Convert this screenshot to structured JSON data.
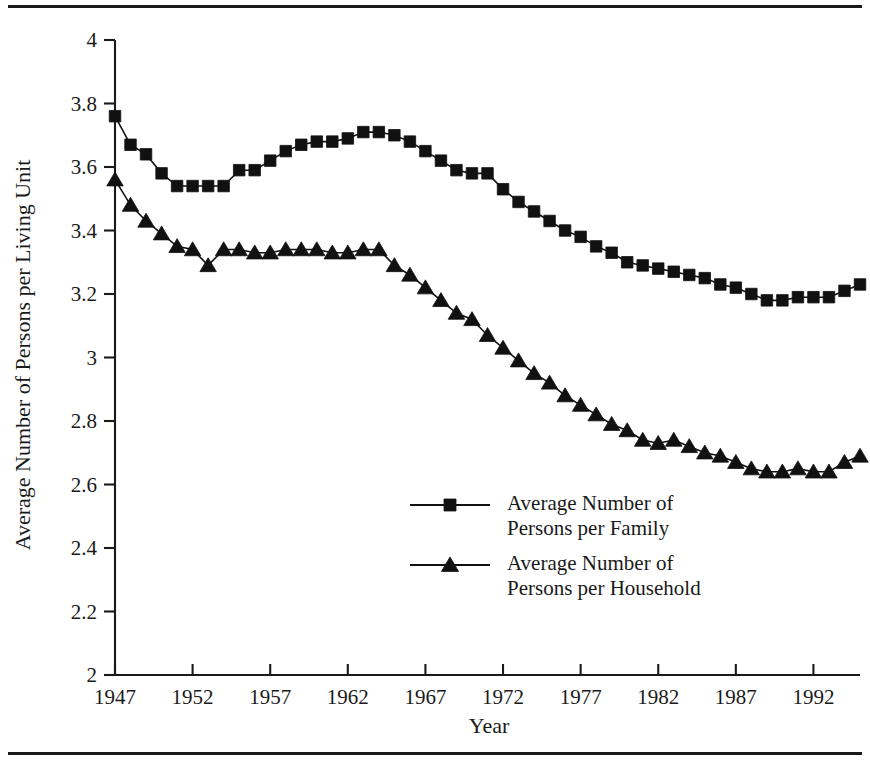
{
  "figure": {
    "top_rule": "horizontal-rule",
    "bottom_rule": "horizontal-rule"
  },
  "chart_data": {
    "type": "line",
    "title": "",
    "xlabel": "Year",
    "ylabel": "Average Number of Persons per Living Unit",
    "xlim": [
      1947,
      1995
    ],
    "ylim": [
      2,
      4
    ],
    "ytick_labels": [
      "2",
      "2.2",
      "2.4",
      "2.6",
      "2.8",
      "3",
      "3.2",
      "3.4",
      "3.6",
      "3.8",
      "4"
    ],
    "ytick_values": [
      2,
      2.2,
      2.4,
      2.6,
      2.8,
      3,
      3.2,
      3.4,
      3.6,
      3.8,
      4
    ],
    "xtick_labels": [
      "1947",
      "1952",
      "1957",
      "1962",
      "1967",
      "1972",
      "1977",
      "1982",
      "1987",
      "1992"
    ],
    "xtick_values": [
      1947,
      1952,
      1957,
      1962,
      1967,
      1972,
      1977,
      1982,
      1987,
      1992
    ],
    "grid": false,
    "legend_position": "center",
    "x": [
      1947,
      1948,
      1949,
      1950,
      1951,
      1952,
      1953,
      1954,
      1955,
      1956,
      1957,
      1958,
      1959,
      1960,
      1961,
      1962,
      1963,
      1964,
      1965,
      1966,
      1967,
      1968,
      1969,
      1970,
      1971,
      1972,
      1973,
      1974,
      1975,
      1976,
      1977,
      1978,
      1979,
      1980,
      1981,
      1982,
      1983,
      1984,
      1985,
      1986,
      1987,
      1988,
      1989,
      1990,
      1991,
      1992,
      1993,
      1994,
      1995
    ],
    "series": [
      {
        "name": "Average Number of Persons per Family",
        "marker": "square",
        "values": [
          3.76,
          3.67,
          3.64,
          3.58,
          3.54,
          3.54,
          3.54,
          3.54,
          3.59,
          3.59,
          3.62,
          3.65,
          3.67,
          3.68,
          3.68,
          3.69,
          3.71,
          3.71,
          3.7,
          3.68,
          3.65,
          3.62,
          3.59,
          3.58,
          3.58,
          3.53,
          3.49,
          3.46,
          3.43,
          3.4,
          3.38,
          3.35,
          3.33,
          3.3,
          3.29,
          3.28,
          3.27,
          3.26,
          3.25,
          3.23,
          3.22,
          3.2,
          3.18,
          3.18,
          3.19,
          3.19,
          3.19,
          3.21,
          3.23
        ]
      },
      {
        "name": "Average Number of Persons per Household",
        "marker": "triangle",
        "values": [
          3.56,
          3.48,
          3.43,
          3.39,
          3.35,
          3.34,
          3.29,
          3.34,
          3.34,
          3.33,
          3.33,
          3.34,
          3.34,
          3.34,
          3.33,
          3.33,
          3.34,
          3.34,
          3.29,
          3.26,
          3.22,
          3.18,
          3.14,
          3.12,
          3.07,
          3.03,
          2.99,
          2.95,
          2.92,
          2.88,
          2.85,
          2.82,
          2.79,
          2.77,
          2.74,
          2.73,
          2.74,
          2.72,
          2.7,
          2.69,
          2.67,
          2.65,
          2.64,
          2.64,
          2.65,
          2.64,
          2.64,
          2.67,
          2.69
        ]
      }
    ]
  },
  "legend": {
    "entries": [
      {
        "line1": "Average Number of",
        "line2": "Persons per Family",
        "marker": "square-marker"
      },
      {
        "line1": "Average Number of",
        "line2": "Persons per Household",
        "marker": "triangle-marker"
      }
    ]
  },
  "colors": {
    "ink": "#111111",
    "background": "#ffffff"
  }
}
